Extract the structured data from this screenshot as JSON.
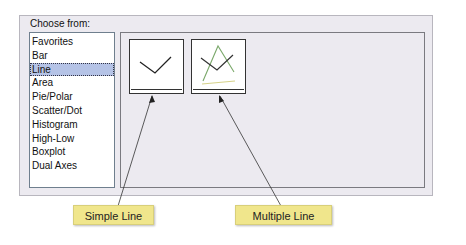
{
  "panel": {
    "label": "Choose from:",
    "list": [
      {
        "label": "Favorites",
        "selected": false
      },
      {
        "label": "Bar",
        "selected": false
      },
      {
        "label": "Line",
        "selected": true
      },
      {
        "label": "Area",
        "selected": false
      },
      {
        "label": "Pie/Polar",
        "selected": false
      },
      {
        "label": "Scatter/Dot",
        "selected": false
      },
      {
        "label": "Histogram",
        "selected": false
      },
      {
        "label": "High-Low",
        "selected": false
      },
      {
        "label": "Boxplot",
        "selected": false
      },
      {
        "label": "Dual Axes",
        "selected": false
      }
    ]
  },
  "gallery": {
    "thumbnails": [
      {
        "icon": "simple-line-chart-icon"
      },
      {
        "icon": "multiple-line-chart-icon"
      }
    ]
  },
  "callouts": [
    {
      "label": "Simple Line"
    },
    {
      "label": "Multiple Line"
    }
  ],
  "colors": {
    "callout_bg": "#f0e68c",
    "selected_bg": "#b5c3e6",
    "panel_bg": "#eceaf0"
  }
}
